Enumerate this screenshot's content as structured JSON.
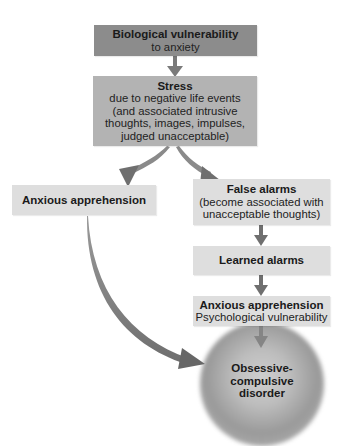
{
  "diagram": {
    "type": "flowchart",
    "nodes": [
      {
        "id": "bio",
        "title": "Biological vulnerability",
        "subtitle": "to anxiety"
      },
      {
        "id": "stress",
        "title": "Stress",
        "subtitle_lines": [
          "due to negative life events",
          "(and associated intrusive",
          "thoughts, images, impulses,",
          "judged unacceptable)"
        ]
      },
      {
        "id": "anx_left",
        "title": "Anxious apprehension"
      },
      {
        "id": "false",
        "title": "False alarms",
        "subtitle_lines": [
          "(become associated with",
          "unacceptable thoughts)"
        ]
      },
      {
        "id": "learned",
        "title": "Learned alarms"
      },
      {
        "id": "anx_right",
        "title": "Anxious apprehension",
        "subtitle": "Psychological vulnerability"
      },
      {
        "id": "ocd",
        "title_lines": [
          "Obsessive-compulsive",
          "disorder"
        ]
      }
    ],
    "edges": [
      {
        "from": "bio",
        "to": "stress"
      },
      {
        "from": "stress",
        "to": "anx_left"
      },
      {
        "from": "stress",
        "to": "false"
      },
      {
        "from": "false",
        "to": "learned"
      },
      {
        "from": "learned",
        "to": "anx_right"
      },
      {
        "from": "anx_right",
        "to": "ocd"
      },
      {
        "from": "anx_left",
        "to": "ocd"
      }
    ]
  },
  "colors": {
    "box_dark": "#8c8c8c",
    "box_mid": "#b3b3b3",
    "box_light": "#dedede",
    "arrow": "#777777",
    "blob_center": "#cfcfcf",
    "blob_edge": "#9a9a9a"
  }
}
